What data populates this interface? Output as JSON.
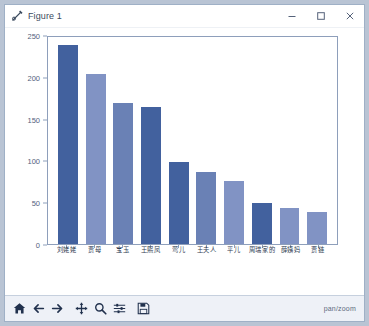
{
  "window": {
    "title": "Figure 1",
    "icon": "matplotlib-figure-icon",
    "minimize_label": "─",
    "maximize_label": "□",
    "close_label": "✕"
  },
  "toolbar": {
    "buttons": [
      {
        "name": "home-icon",
        "tooltip": "Reset original view"
      },
      {
        "name": "back-arrow-icon",
        "tooltip": "Back to previous view"
      },
      {
        "name": "forward-arrow-icon",
        "tooltip": "Forward to next view"
      },
      {
        "name": "pan-move-icon",
        "tooltip": "Pan axes with left mouse, zoom with right"
      },
      {
        "name": "zoom-magnifier-icon",
        "tooltip": "Zoom to rectangle"
      },
      {
        "name": "configure-subplots-icon",
        "tooltip": "Configure subplots"
      },
      {
        "name": "save-floppy-icon",
        "tooltip": "Save the figure"
      }
    ],
    "status": "pan/zoom"
  },
  "chart_data": {
    "type": "bar",
    "title": "",
    "xlabel": "",
    "ylabel": "",
    "categories": [
      "刘姥姥",
      "贾母",
      "宝玉",
      "王熙凤",
      "莺儿",
      "王夫人",
      "平儿",
      "周瑞家的",
      "薛姨妈",
      "贾链"
    ],
    "values": [
      240,
      205,
      170,
      165,
      99,
      87,
      76,
      49,
      43,
      39
    ],
    "colors": [
      "#42619e",
      "#8193c4",
      "#6a81b5",
      "#42619e",
      "#42619e",
      "#6a81b5",
      "#8193c4",
      "#42619e",
      "#8193c4",
      "#8193c4"
    ],
    "yticks": [
      0,
      50,
      100,
      150,
      200,
      250
    ],
    "ylim": [
      0,
      250
    ],
    "grid": false,
    "legend": false,
    "axis_color": "#8e9fbb",
    "tick_label_color": "#53627c"
  }
}
